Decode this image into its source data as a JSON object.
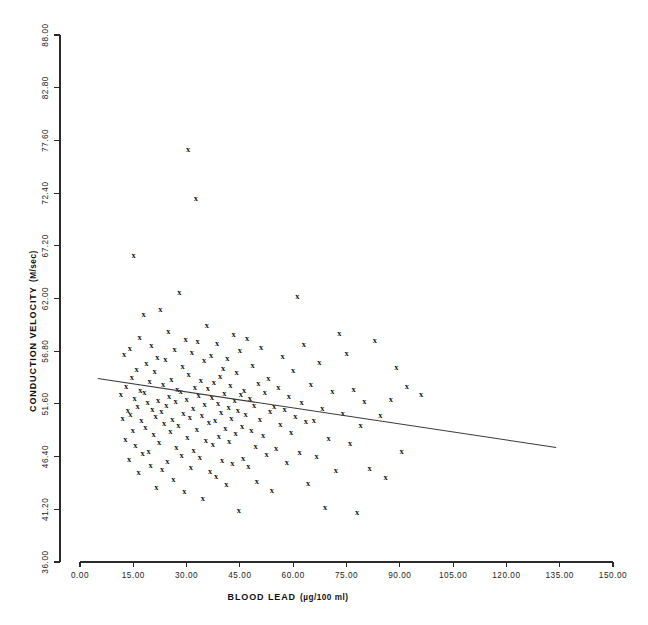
{
  "figure": {
    "background_color": "#ffffff",
    "foreground_color": "#1a1a1a",
    "marker_glyph": "x",
    "width": 648,
    "height": 625
  },
  "chart_data": {
    "type": "scatter",
    "title": "",
    "xlabel": "BLOOD LEAD (µg/100 ml)",
    "xlabel_main": "BLOOD LEAD",
    "xlabel_units": "(µg/100 ml)",
    "ylabel": "CONDUCTION VELOCITY (M/sec)",
    "ylabel_main": "CONDUCTION VELOCITY",
    "ylabel_units": "(M/sec)",
    "xlim": [
      0.0,
      150.0
    ],
    "ylim": [
      36.0,
      88.0
    ],
    "xticks": [
      0.0,
      15.0,
      30.0,
      45.0,
      60.0,
      75.0,
      90.0,
      105.0,
      120.0,
      135.0,
      150.0
    ],
    "xtick_labels": [
      "0.00",
      "15.00",
      "30.00",
      "45.00",
      "60.00",
      "75.00",
      "90.00",
      "105.00",
      "120.00",
      "135.00",
      "150.00"
    ],
    "yticks": [
      36.0,
      41.2,
      46.4,
      51.6,
      56.8,
      62.0,
      67.2,
      72.4,
      77.6,
      82.8,
      88.0
    ],
    "ytick_labels": [
      "36.00",
      "41.20",
      "46.40",
      "51.60",
      "56.80",
      "62.00",
      "67.20",
      "72.40",
      "77.60",
      "82.80",
      "88.00"
    ],
    "grid": false,
    "legend": null,
    "marker": "x",
    "series_name": "subjects",
    "trendline": {
      "type": "linear-regression",
      "x_start": 5.0,
      "y_start": 54.1,
      "x_end": 134.0,
      "y_end": 47.3,
      "slope": -0.0527,
      "intercept": 54.36
    },
    "points": [
      [
        11.5,
        52.6
      ],
      [
        12.0,
        50.2
      ],
      [
        12.4,
        56.5
      ],
      [
        12.8,
        48.1
      ],
      [
        13.0,
        53.4
      ],
      [
        13.5,
        51.0
      ],
      [
        13.8,
        46.2
      ],
      [
        14.0,
        57.1
      ],
      [
        14.2,
        50.6
      ],
      [
        14.6,
        54.3
      ],
      [
        14.9,
        49.0
      ],
      [
        15.1,
        66.3
      ],
      [
        15.4,
        52.2
      ],
      [
        15.6,
        47.5
      ],
      [
        15.9,
        55.0
      ],
      [
        16.2,
        51.4
      ],
      [
        16.5,
        44.9
      ],
      [
        16.8,
        58.2
      ],
      [
        17.0,
        53.0
      ],
      [
        17.3,
        50.0
      ],
      [
        17.6,
        46.8
      ],
      [
        17.9,
        60.5
      ],
      [
        18.1,
        52.8
      ],
      [
        18.4,
        49.3
      ],
      [
        18.7,
        55.6
      ],
      [
        19.0,
        51.8
      ],
      [
        19.3,
        47.0
      ],
      [
        19.6,
        53.9
      ],
      [
        19.9,
        45.6
      ],
      [
        20.1,
        57.4
      ],
      [
        20.4,
        51.1
      ],
      [
        20.7,
        48.6
      ],
      [
        21.0,
        54.8
      ],
      [
        21.3,
        50.4
      ],
      [
        21.5,
        43.4
      ],
      [
        21.8,
        56.2
      ],
      [
        22.0,
        52.0
      ],
      [
        22.3,
        47.8
      ],
      [
        22.6,
        61.0
      ],
      [
        22.9,
        50.9
      ],
      [
        23.1,
        45.2
      ],
      [
        23.4,
        53.6
      ],
      [
        23.7,
        49.7
      ],
      [
        24.0,
        56.0
      ],
      [
        24.3,
        51.5
      ],
      [
        24.6,
        46.0
      ],
      [
        24.9,
        58.8
      ],
      [
        25.1,
        52.4
      ],
      [
        25.4,
        48.9
      ],
      [
        25.7,
        54.1
      ],
      [
        26.0,
        50.1
      ],
      [
        26.3,
        44.2
      ],
      [
        26.6,
        57.0
      ],
      [
        26.9,
        51.9
      ],
      [
        27.1,
        47.3
      ],
      [
        27.4,
        53.1
      ],
      [
        27.7,
        49.5
      ],
      [
        28.0,
        62.6
      ],
      [
        28.3,
        52.9
      ],
      [
        28.6,
        46.6
      ],
      [
        28.9,
        55.3
      ],
      [
        29.1,
        50.7
      ],
      [
        29.4,
        43.0
      ],
      [
        29.7,
        58.0
      ],
      [
        30.0,
        52.1
      ],
      [
        30.2,
        48.3
      ],
      [
        30.4,
        76.8
      ],
      [
        30.6,
        54.6
      ],
      [
        30.9,
        50.3
      ],
      [
        31.2,
        45.4
      ],
      [
        31.5,
        56.7
      ],
      [
        31.8,
        51.2
      ],
      [
        32.0,
        47.1
      ],
      [
        32.3,
        53.3
      ],
      [
        32.6,
        71.9
      ],
      [
        32.9,
        49.1
      ],
      [
        33.1,
        57.8
      ],
      [
        33.4,
        52.5
      ],
      [
        33.7,
        46.4
      ],
      [
        34.0,
        54.0
      ],
      [
        34.3,
        50.5
      ],
      [
        34.6,
        42.3
      ],
      [
        34.9,
        55.9
      ],
      [
        35.1,
        51.6
      ],
      [
        35.4,
        48.0
      ],
      [
        35.7,
        59.4
      ],
      [
        36.0,
        53.2
      ],
      [
        36.3,
        49.8
      ],
      [
        36.6,
        45.0
      ],
      [
        36.9,
        56.4
      ],
      [
        37.1,
        52.3
      ],
      [
        37.4,
        47.6
      ],
      [
        37.7,
        53.8
      ],
      [
        38.0,
        50.0
      ],
      [
        38.3,
        44.5
      ],
      [
        38.6,
        57.6
      ],
      [
        38.9,
        51.7
      ],
      [
        39.1,
        48.4
      ],
      [
        39.4,
        54.4
      ],
      [
        39.7,
        50.8
      ],
      [
        40.0,
        46.1
      ],
      [
        40.3,
        55.1
      ],
      [
        40.6,
        52.7
      ],
      [
        40.9,
        49.2
      ],
      [
        41.2,
        43.7
      ],
      [
        41.5,
        56.1
      ],
      [
        41.8,
        51.3
      ],
      [
        42.0,
        47.9
      ],
      [
        42.3,
        53.5
      ],
      [
        42.6,
        50.2
      ],
      [
        42.9,
        45.8
      ],
      [
        43.2,
        58.5
      ],
      [
        43.5,
        52.0
      ],
      [
        43.8,
        48.7
      ],
      [
        44.1,
        54.7
      ],
      [
        44.4,
        51.0
      ],
      [
        44.7,
        41.1
      ],
      [
        45.0,
        56.9
      ],
      [
        45.3,
        52.6
      ],
      [
        45.6,
        49.4
      ],
      [
        45.9,
        46.3
      ],
      [
        46.2,
        53.0
      ],
      [
        46.6,
        50.6
      ],
      [
        47.0,
        58.1
      ],
      [
        47.4,
        45.5
      ],
      [
        47.8,
        52.2
      ],
      [
        48.2,
        49.0
      ],
      [
        48.6,
        55.4
      ],
      [
        49.0,
        51.5
      ],
      [
        49.4,
        47.4
      ],
      [
        49.8,
        44.0
      ],
      [
        50.2,
        53.7
      ],
      [
        50.6,
        50.1
      ],
      [
        51.0,
        57.2
      ],
      [
        51.5,
        48.5
      ],
      [
        52.0,
        52.8
      ],
      [
        52.5,
        46.7
      ],
      [
        53.0,
        54.2
      ],
      [
        53.5,
        50.9
      ],
      [
        54.0,
        43.1
      ],
      [
        54.6,
        51.4
      ],
      [
        55.2,
        47.2
      ],
      [
        55.8,
        53.3
      ],
      [
        56.4,
        49.6
      ],
      [
        57.0,
        56.3
      ],
      [
        57.6,
        51.1
      ],
      [
        58.2,
        45.9
      ],
      [
        58.8,
        52.4
      ],
      [
        59.4,
        48.8
      ],
      [
        60.0,
        54.9
      ],
      [
        60.6,
        50.4
      ],
      [
        61.2,
        62.2
      ],
      [
        61.8,
        46.9
      ],
      [
        62.4,
        51.8
      ],
      [
        63.0,
        57.5
      ],
      [
        63.6,
        49.9
      ],
      [
        64.2,
        43.8
      ],
      [
        65.0,
        53.6
      ],
      [
        65.8,
        50.0
      ],
      [
        66.6,
        46.5
      ],
      [
        67.4,
        55.7
      ],
      [
        68.2,
        51.2
      ],
      [
        69.0,
        41.4
      ],
      [
        70.0,
        48.2
      ],
      [
        71.0,
        52.9
      ],
      [
        72.0,
        45.1
      ],
      [
        73.0,
        58.6
      ],
      [
        74.0,
        50.7
      ],
      [
        75.0,
        56.6
      ],
      [
        76.0,
        47.7
      ],
      [
        77.0,
        53.1
      ],
      [
        78.0,
        40.9
      ],
      [
        79.0,
        49.5
      ],
      [
        80.0,
        51.9
      ],
      [
        81.5,
        45.3
      ],
      [
        83.0,
        57.9
      ],
      [
        84.5,
        50.5
      ],
      [
        86.0,
        44.4
      ],
      [
        87.5,
        52.1
      ],
      [
        89.0,
        55.2
      ],
      [
        90.5,
        47.0
      ],
      [
        92.0,
        53.4
      ],
      [
        96.0,
        52.6
      ]
    ],
    "n_points": 182
  }
}
